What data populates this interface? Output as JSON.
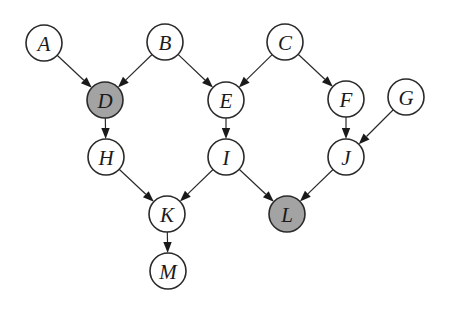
{
  "diagram": {
    "type": "directed-acyclic-graph",
    "colors": {
      "observed_fill": "#a3a3a3",
      "unobserved_fill": "#ffffff",
      "stroke": "#2a2a2a"
    },
    "nodes": [
      {
        "id": "A",
        "label": "A",
        "observed": false
      },
      {
        "id": "B",
        "label": "B",
        "observed": false
      },
      {
        "id": "C",
        "label": "C",
        "observed": false
      },
      {
        "id": "D",
        "label": "D",
        "observed": true
      },
      {
        "id": "E",
        "label": "E",
        "observed": false
      },
      {
        "id": "F",
        "label": "F",
        "observed": false
      },
      {
        "id": "G",
        "label": "G",
        "observed": false
      },
      {
        "id": "H",
        "label": "H",
        "observed": false
      },
      {
        "id": "I",
        "label": "I",
        "observed": false
      },
      {
        "id": "J",
        "label": "J",
        "observed": false
      },
      {
        "id": "K",
        "label": "K",
        "observed": false
      },
      {
        "id": "L",
        "label": "L",
        "observed": true
      },
      {
        "id": "M",
        "label": "M",
        "observed": false
      }
    ],
    "edges": [
      {
        "from": "A",
        "to": "D"
      },
      {
        "from": "B",
        "to": "D"
      },
      {
        "from": "B",
        "to": "E"
      },
      {
        "from": "C",
        "to": "E"
      },
      {
        "from": "C",
        "to": "F"
      },
      {
        "from": "G",
        "to": "J"
      },
      {
        "from": "D",
        "to": "H"
      },
      {
        "from": "E",
        "to": "I"
      },
      {
        "from": "F",
        "to": "J"
      },
      {
        "from": "H",
        "to": "K"
      },
      {
        "from": "I",
        "to": "K"
      },
      {
        "from": "I",
        "to": "L"
      },
      {
        "from": "J",
        "to": "L"
      },
      {
        "from": "K",
        "to": "M"
      }
    ]
  }
}
